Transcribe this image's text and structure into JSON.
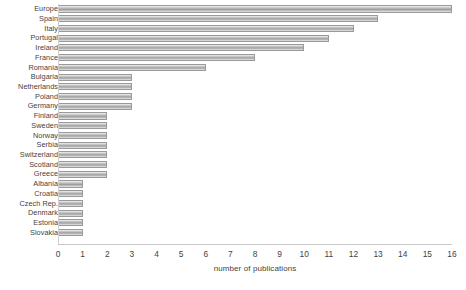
{
  "chart_data": {
    "type": "bar",
    "orientation": "horizontal",
    "title": "",
    "xlabel": "number of publications",
    "ylabel": "",
    "xlim": [
      0,
      16
    ],
    "xticks": [
      0,
      1,
      2,
      3,
      4,
      5,
      6,
      7,
      8,
      9,
      10,
      11,
      12,
      13,
      14,
      15,
      16
    ],
    "grid": false,
    "legend": false,
    "categories": [
      "Europe",
      "Spain",
      "Italy",
      "Portugal",
      "Ireland",
      "France",
      "Romania",
      "Bulgaria",
      "Netherlands",
      "Poland",
      "Germany",
      "Finland",
      "Sweden",
      "Norway",
      "Serbia",
      "Switzerland",
      "Scotland",
      "Greece",
      "Albania",
      "Croatia",
      "Czech Rep.",
      "Denmark",
      "Estonia",
      "Slovakia"
    ],
    "values": [
      16,
      13,
      12,
      11,
      10,
      8,
      6,
      3,
      3,
      3,
      3,
      2,
      2,
      2,
      2,
      2,
      2,
      2,
      1,
      1,
      1,
      1,
      1,
      1
    ],
    "series": [
      {
        "name": "number of publications",
        "values": [
          16,
          13,
          12,
          11,
          10,
          8,
          6,
          3,
          3,
          3,
          3,
          2,
          2,
          2,
          2,
          2,
          2,
          2,
          1,
          1,
          1,
          1,
          1,
          1
        ]
      }
    ],
    "colors": {
      "bar_fill_light": "#f2f2f2",
      "bar_fill_mid": "#a5a5a5",
      "bar_border": "#9a9a9a",
      "axis": "#c8c8c8",
      "text": "#3f3f3f"
    }
  }
}
